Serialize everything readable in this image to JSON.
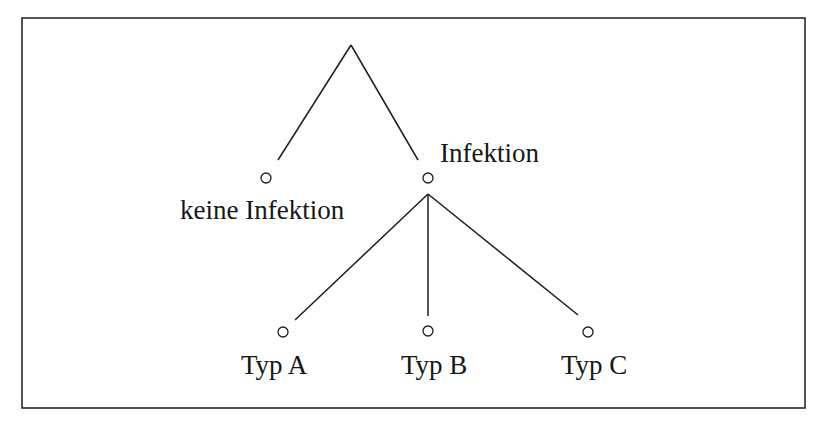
{
  "diagram": {
    "type": "tree",
    "language": "de",
    "root": {
      "label": "",
      "children": [
        "keine Infektion",
        "Infektion"
      ]
    },
    "nodes": {
      "no_infection": {
        "label": "keine Infektion"
      },
      "infection": {
        "label": "Infektion",
        "children": [
          "Typ A",
          "Typ B",
          "Typ C"
        ]
      },
      "type_a": {
        "label": "Typ A"
      },
      "type_b": {
        "label": "Typ B"
      },
      "type_c": {
        "label": "Typ C"
      }
    },
    "colors": {
      "line": "#1e1e1e",
      "frame": "#2a2a2a",
      "text": "#161616",
      "background": "#ffffff"
    }
  }
}
